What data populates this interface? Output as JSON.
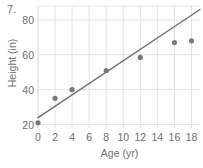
{
  "problem": {
    "number_label": "7."
  },
  "chart_data": {
    "type": "scatter",
    "title": "",
    "xlabel": "Age (yr)",
    "ylabel": "Height (in)",
    "xlim": [
      0,
      19
    ],
    "ylim": [
      18,
      88
    ],
    "grid": true,
    "legend": null,
    "xticks": [
      0,
      2,
      4,
      6,
      8,
      10,
      12,
      14,
      16,
      18
    ],
    "xtick_labels": [
      "0",
      "2",
      "4",
      "6",
      "8",
      "10",
      "12",
      "14",
      "16",
      "18"
    ],
    "yticks": [
      20,
      40,
      60,
      80
    ],
    "ytick_labels": [
      "20",
      "40",
      "60",
      "80"
    ],
    "series": [
      {
        "name": "Height measurements",
        "type": "scatter",
        "marker": "circle",
        "color": "#7a7a7a",
        "x": [
          0,
          2,
          4,
          8,
          12,
          16,
          18
        ],
        "y": [
          21,
          35,
          40,
          51,
          58.5,
          67,
          68
        ]
      },
      {
        "name": "Trend line",
        "type": "line",
        "color": "#6e6e6e",
        "x": [
          0,
          19
        ],
        "y": [
          24,
          86
        ]
      }
    ],
    "colors": {
      "marker": "#7a7a7a",
      "line": "#6e6e6e",
      "grid": "#e2e2e2",
      "axis_text": "#6e6e6e",
      "background": "#ffffff"
    }
  }
}
